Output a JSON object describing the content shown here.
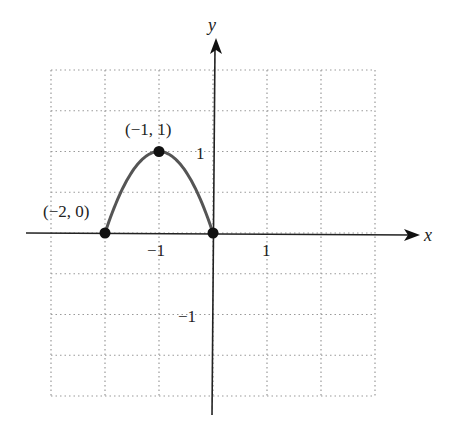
{
  "chart_data": {
    "type": "line",
    "title": "",
    "xlabel": "x",
    "ylabel": "y",
    "xlim": [
      -3,
      3
    ],
    "ylim": [
      -2,
      2
    ],
    "grid": true,
    "grid_style": "dotted",
    "x_grid_step": 1,
    "y_grid_step": 0.5,
    "x_ticks": [
      {
        "value": -1,
        "label": "−1"
      },
      {
        "value": 1,
        "label": "1"
      }
    ],
    "y_ticks": [
      {
        "value": 1,
        "label": "1"
      },
      {
        "value": -1,
        "label": "−1"
      }
    ],
    "series": [
      {
        "name": "parabola y = -x(x+2)",
        "function": "-x^2 - 2x",
        "domain": [
          -2,
          0
        ],
        "color": "#555555",
        "x": [
          -2,
          -1.5,
          -1,
          -0.5,
          0
        ],
        "y": [
          0,
          0.75,
          1,
          0.75,
          0
        ]
      }
    ],
    "points": [
      {
        "x": -2,
        "y": 0,
        "label": "(−2, 0)"
      },
      {
        "x": -1,
        "y": 1,
        "label": "(−1, 1)"
      },
      {
        "x": 0,
        "y": 0,
        "label": ""
      }
    ],
    "colors": {
      "curve": "#555555",
      "axes": "#222222",
      "grid": "#999999",
      "points": "#111111"
    }
  }
}
